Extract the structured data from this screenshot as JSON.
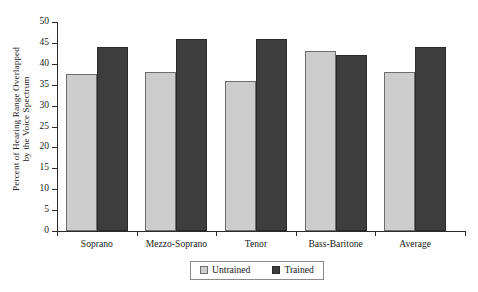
{
  "chart_data": {
    "type": "bar",
    "title": "",
    "xlabel": "",
    "ylabel": "Percent of Hearing Range Overlapped by the Voice Spectrum",
    "ylabel_line1": "Percent of Hearing Range Overlapped",
    "ylabel_line2": "by the Voice Spectrum",
    "categories": [
      "Soprano",
      "Mezzo-Soprano",
      "Tenor",
      "Bass-Baritone",
      "Average"
    ],
    "series": [
      {
        "name": "Untrained",
        "color": "#cdcdcd",
        "values": [
          37.5,
          38,
          36,
          43,
          38
        ]
      },
      {
        "name": "Trained",
        "color": "#3d3d3d",
        "values": [
          44,
          46,
          46,
          42,
          44
        ]
      }
    ],
    "ylim": [
      0,
      50
    ],
    "yticks": [
      0,
      5,
      10,
      15,
      20,
      25,
      30,
      35,
      40,
      45,
      50
    ],
    "ytick_labels": [
      "0",
      "5",
      "10",
      "15",
      "20",
      "25",
      "30",
      "35",
      "40",
      "45",
      "50"
    ],
    "grid": false,
    "legend_position": "bottom-center"
  },
  "legend": {
    "items": [
      {
        "label": "Untrained"
      },
      {
        "label": "Trained"
      }
    ]
  }
}
